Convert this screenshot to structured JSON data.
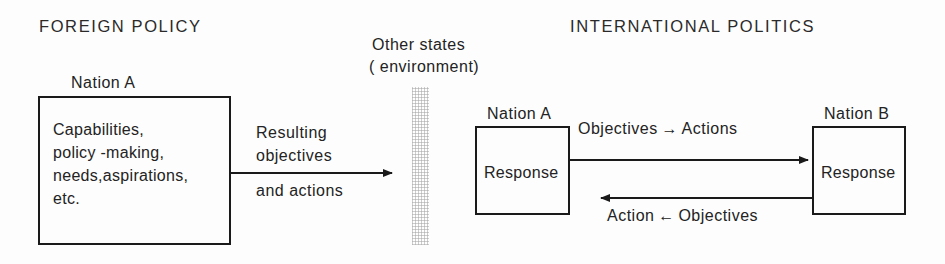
{
  "figure": {
    "type": "diagram",
    "title_left": "FOREIGN POLICY",
    "title_right": "INTERNATIONAL POLITICS",
    "environment_label_line1": "Other states",
    "environment_label_line2": "( environment)"
  },
  "foreign_policy": {
    "nation_label": "Nation A",
    "box_lines": {
      "l1": "Capabilities,",
      "l2": "policy -making,",
      "l3": "needs,aspirations,",
      "l4": "etc."
    },
    "arrow_label_above_1": "Resulting",
    "arrow_label_above_2": "objectives",
    "arrow_label_below": "and actions"
  },
  "international_politics": {
    "nation_a_label": "Nation A",
    "nation_a_box_text": "Response",
    "nation_b_label": "Nation B",
    "nation_b_box_text": "Response",
    "outbound_label": "Objectives → Actions",
    "inbound_label": "Action ← Objectives"
  },
  "colors": {
    "ink": "#1a1a1a",
    "paper": "#fdfdfd",
    "band": "#969696"
  }
}
